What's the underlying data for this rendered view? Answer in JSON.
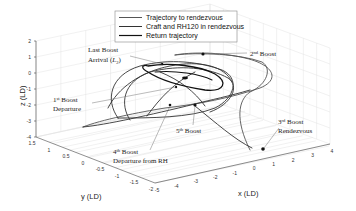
{
  "chart_data": {
    "type": "line",
    "subtype": "3d-trajectory",
    "title": "",
    "xlabel": "x (LD)",
    "ylabel": "y (LD)",
    "zlabel": "z (LD)",
    "xlim": [
      -5,
      4
    ],
    "ylim": [
      -2,
      1.5
    ],
    "zlim": [
      -4,
      2
    ],
    "x_ticks": [
      "-5",
      "-4",
      "-3",
      "-2",
      "-1",
      "0",
      "1",
      "2",
      "3",
      "4"
    ],
    "y_ticks": [
      "1.5",
      "1",
      "0.5",
      "0",
      "-0.5",
      "-1",
      "-1.5",
      "-2"
    ],
    "z_ticks": [
      "2",
      "1",
      "0",
      "-1",
      "-2",
      "-3",
      "-4"
    ],
    "grid": true,
    "legend": {
      "placement": "top-center",
      "entries": [
        {
          "name": "Trajectory to rendezvous",
          "color": "#555555"
        },
        {
          "name": "Craft and RH120 in rendezvous",
          "color": "#333333"
        },
        {
          "name": "Return trajectory",
          "color": "#111111"
        }
      ]
    },
    "series": [
      {
        "name": "Trajectory to rendezvous",
        "color": "#555555",
        "points": [
          [
            -1.0,
            1.0,
            -3.2
          ],
          [
            -2.2,
            0.8,
            -3.4
          ],
          [
            -4.5,
            1.2,
            -3.6
          ],
          [
            -3.0,
            0.5,
            -2.2
          ],
          [
            -1.5,
            0.2,
            -1.0
          ],
          [
            0.0,
            0.0,
            -0.6
          ],
          [
            1.5,
            0.3,
            0.2
          ],
          [
            2.5,
            0.8,
            0.8
          ],
          [
            1.0,
            1.2,
            1.3
          ],
          [
            -0.5,
            1.2,
            1.2
          ],
          [
            -0.7,
            0.9,
            1.0
          ],
          [
            2.5,
            0.8,
            0.6
          ],
          [
            3.5,
            0.2,
            -0.4
          ],
          [
            3.2,
            -0.6,
            -2.0
          ],
          [
            2.8,
            -1.0,
            -3.6
          ]
        ]
      },
      {
        "name": "Craft and RH120 in rendezvous",
        "color": "#333333",
        "points": [
          [
            2.8,
            -1.0,
            -3.6
          ],
          [
            1.0,
            -0.8,
            -2.8
          ],
          [
            -1.0,
            -0.4,
            -1.5
          ],
          [
            -2.5,
            0.4,
            -0.6
          ],
          [
            -2.0,
            1.0,
            0.2
          ],
          [
            0.0,
            1.2,
            0.5
          ],
          [
            2.0,
            0.8,
            0.0
          ],
          [
            2.2,
            0.0,
            -1.0
          ],
          [
            0.5,
            -0.5,
            -1.6
          ],
          [
            -1.5,
            -0.2,
            -1.2
          ],
          [
            -2.8,
            0.4,
            -0.4
          ],
          [
            -2.2,
            1.2,
            0.4
          ],
          [
            0.5,
            1.3,
            0.6
          ],
          [
            2.5,
            0.6,
            0.2
          ],
          [
            2.0,
            -0.2,
            -0.8
          ]
        ]
      },
      {
        "name": "Return trajectory",
        "color": "#111111",
        "points": [
          [
            2.0,
            -0.2,
            -0.8
          ],
          [
            1.0,
            0.2,
            -0.2
          ],
          [
            -0.5,
            0.6,
            0.3
          ],
          [
            -1.5,
            1.0,
            0.6
          ],
          [
            -0.5,
            1.3,
            0.7
          ],
          [
            1.0,
            1.1,
            0.6
          ],
          [
            2.5,
            0.6,
            0.3
          ],
          [
            1.5,
            0.2,
            0.1
          ],
          [
            0.0,
            0.3,
            0.2
          ]
        ]
      }
    ],
    "annotations": [
      {
        "text": "Last Boost Arrival (L2)",
        "label_line1": "Last Boost",
        "label_line2_pre": "Arrival (",
        "label_line2_var": "L",
        "label_line2_sub": "2",
        "label_line2_post": ")"
      },
      {
        "text": "1st Boost Departure",
        "num": "1",
        "sup": "st",
        "word": " Boost",
        "line2": "Departure"
      },
      {
        "text": "2nd Boost",
        "num": "2",
        "sup": "nd",
        "word": " Boost"
      },
      {
        "text": "3rd Boost Rendezvous",
        "num": "3",
        "sup": "rd",
        "word": " Boost",
        "line2": "Rendezvous"
      },
      {
        "text": "4th Boost Departure from RH",
        "num": "4",
        "sup": "th",
        "word": " Boost",
        "line2": "Departure from RH"
      },
      {
        "text": "5th Boost",
        "num": "5",
        "sup": "th",
        "word": " Boost"
      }
    ]
  }
}
